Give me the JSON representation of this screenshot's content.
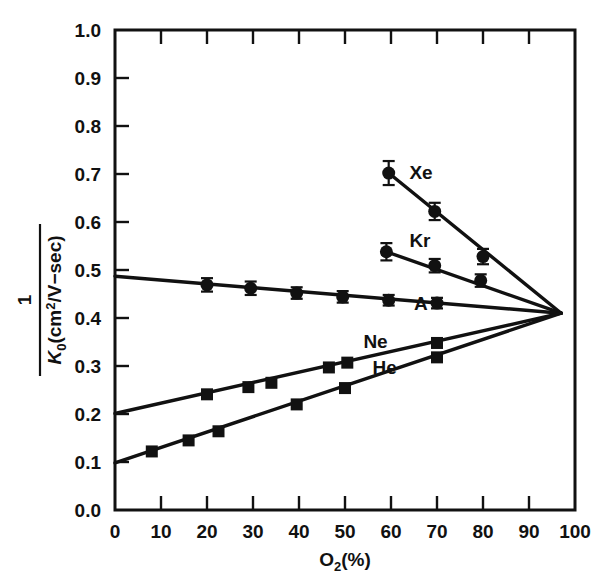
{
  "chart_data": {
    "type": "line",
    "title": "",
    "xlabel": "O2 (%)",
    "xlabel_main": "O",
    "xlabel_sub": "2",
    "xlabel_tail": "(%)",
    "ylabel": "1 / K0 (cm2/V-sec)",
    "ylabel_numerator": "1",
    "ylabel_denominator_main": "K",
    "ylabel_denominator_sub": "0",
    "ylabel_denominator_tail": "(cm",
    "ylabel_denominator_sup": "2",
    "ylabel_denominator_end": "/V−sec)",
    "xlim": [
      0,
      100
    ],
    "ylim": [
      0.0,
      1.0
    ],
    "xticks": [
      0,
      10,
      20,
      30,
      40,
      50,
      60,
      70,
      80,
      90,
      100
    ],
    "xtick_labels": [
      "0",
      "10",
      "20",
      "30",
      "40",
      "50",
      "60",
      "70",
      "80",
      "90",
      "100"
    ],
    "yticks": [
      0.0,
      0.1,
      0.2,
      0.3,
      0.4,
      0.5,
      0.6,
      0.7,
      0.8,
      0.9,
      1.0
    ],
    "ytick_labels": [
      "0.0",
      "0.1",
      "0.2",
      "0.3",
      "0.4",
      "0.5",
      "0.6",
      "0.7",
      "0.8",
      "0.9",
      "1.0"
    ],
    "grid": false,
    "legend_position": "inline-labels",
    "convergence_point": [
      97,
      0.41
    ],
    "series": [
      {
        "name": "Xe",
        "marker": "circle",
        "label_x": 64,
        "label_y": 0.705,
        "line": [
          [
            59.5,
            0.702
          ],
          [
            97,
            0.41
          ]
        ],
        "points": [
          {
            "x": 59.5,
            "y": 0.702,
            "err": 0.025
          },
          {
            "x": 69.5,
            "y": 0.622,
            "err": 0.018
          },
          {
            "x": 80.0,
            "y": 0.528,
            "err": 0.016
          }
        ]
      },
      {
        "name": "Kr",
        "marker": "circle",
        "label_x": 64,
        "label_y": 0.563,
        "line": [
          [
            59.0,
            0.538
          ],
          [
            97,
            0.41
          ]
        ],
        "points": [
          {
            "x": 59.0,
            "y": 0.538,
            "err": 0.018
          },
          {
            "x": 69.5,
            "y": 0.509,
            "err": 0.014
          },
          {
            "x": 79.5,
            "y": 0.478,
            "err": 0.013
          }
        ]
      },
      {
        "name": "A",
        "marker": "circle",
        "label_x": 65,
        "label_y": 0.432,
        "line": [
          [
            0,
            0.487
          ],
          [
            97,
            0.41
          ]
        ],
        "points": [
          {
            "x": 20.0,
            "y": 0.469,
            "err": 0.014
          },
          {
            "x": 29.5,
            "y": 0.462,
            "err": 0.014
          },
          {
            "x": 39.5,
            "y": 0.452,
            "err": 0.012
          },
          {
            "x": 49.5,
            "y": 0.444,
            "err": 0.012
          },
          {
            "x": 59.5,
            "y": 0.437,
            "err": 0.011
          },
          {
            "x": 70.0,
            "y": 0.431,
            "err": 0.011
          }
        ]
      },
      {
        "name": "Ne",
        "marker": "square",
        "label_x": 54,
        "label_y": 0.352,
        "line": [
          [
            0,
            0.201
          ],
          [
            97,
            0.41
          ]
        ],
        "points": [
          {
            "x": 20.0,
            "y": 0.241
          },
          {
            "x": 29.0,
            "y": 0.256
          },
          {
            "x": 34.0,
            "y": 0.265
          },
          {
            "x": 46.5,
            "y": 0.297
          },
          {
            "x": 50.5,
            "y": 0.307
          },
          {
            "x": 70.0,
            "y": 0.348
          }
        ]
      },
      {
        "name": "He",
        "marker": "square",
        "label_x": 56,
        "label_y": 0.297,
        "line": [
          [
            0,
            0.098
          ],
          [
            97,
            0.41
          ]
        ],
        "points": [
          {
            "x": 8.0,
            "y": 0.122
          },
          {
            "x": 16.0,
            "y": 0.145
          },
          {
            "x": 22.5,
            "y": 0.164
          },
          {
            "x": 39.5,
            "y": 0.22
          },
          {
            "x": 50.0,
            "y": 0.254
          },
          {
            "x": 70.0,
            "y": 0.318
          }
        ]
      }
    ]
  }
}
